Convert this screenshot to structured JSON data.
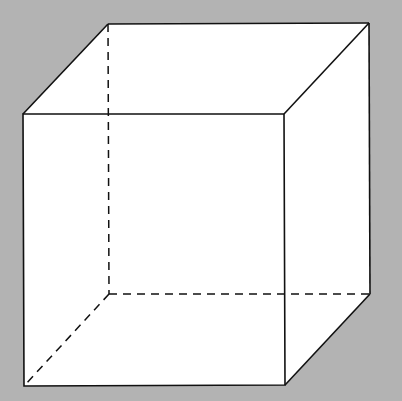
{
  "diagram": {
    "type": "wireframe-cube",
    "background": "#b3b3b3",
    "fill": "#ffffff",
    "stroke": "#111111",
    "front_face": {
      "tl": [
        23,
        114
      ],
      "tr": [
        284,
        114
      ],
      "br": [
        285,
        385
      ],
      "bl": [
        24,
        386
      ]
    },
    "back_face": {
      "tl": [
        108,
        24
      ],
      "tr": [
        369,
        23
      ],
      "br": [
        370,
        294
      ],
      "bl": [
        109,
        294
      ]
    },
    "hidden_edges": [
      "back-left-vertical",
      "back-bottom",
      "depth-bottom-left"
    ]
  }
}
